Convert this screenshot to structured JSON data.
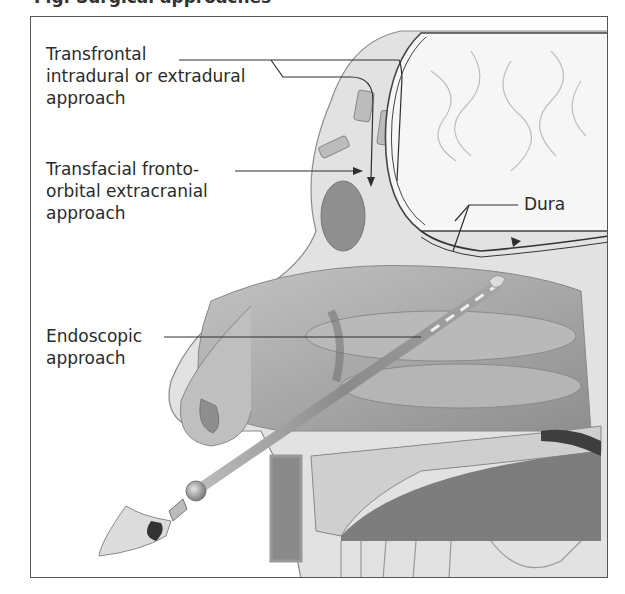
{
  "figure": {
    "caption_partial": "Fig. Surgical approaches",
    "type": "sagittal section of head — surgical approaches to anterior skull base"
  },
  "labels": {
    "transfrontal": "Transfrontal\nintradural or extradural\napproach",
    "transfacial": "Transfacial fronto-\norbital extracranial\napproach",
    "dura": "Dura",
    "endoscopic": "Endoscopic\napproach"
  },
  "colors": {
    "frame": "#555555",
    "text": "#2b2b2b",
    "bone": "#d9d9d9",
    "soft_tissue": "#a8a8a8",
    "brain": "#f4f4f4",
    "dark_cavity": "#6e6e6e"
  }
}
